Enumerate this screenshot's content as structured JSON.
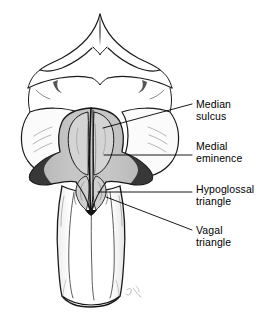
{
  "figure": {
    "background_color": "#ffffff",
    "ink_color": "#000000",
    "fossa_fill": "#c0c0c0",
    "fossa_fill_dark": "#a8a8a8",
    "medulla_fill": "#ffffff",
    "cerebellum_fill": "#ffffff",
    "signature": "Art"
  },
  "labels": [
    {
      "id": "median-sulcus",
      "line1": "Median",
      "line2": "sulcus",
      "x": 196,
      "y": 98,
      "leader": {
        "x1": 103,
        "y1": 128,
        "x2": 192,
        "y2": 104
      }
    },
    {
      "id": "medial-eminence",
      "line1": "Medial",
      "line2": "eminence",
      "x": 196,
      "y": 140,
      "leader": {
        "x1": 104,
        "y1": 155,
        "x2": 192,
        "y2": 155
      }
    },
    {
      "id": "hypoglossal-triangle",
      "line1": "Hypoglossal",
      "line2": "triangle",
      "x": 196,
      "y": 183,
      "leader": {
        "x1": 98,
        "y1": 192,
        "x2": 192,
        "y2": 192
      }
    },
    {
      "id": "vagal-triangle",
      "line1": "Vagal",
      "line2": "triangle",
      "x": 196,
      "y": 224,
      "leader": {
        "x1": 106,
        "y1": 197,
        "x2": 192,
        "y2": 230
      }
    }
  ]
}
